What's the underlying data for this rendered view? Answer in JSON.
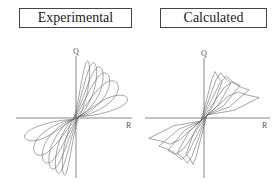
{
  "chart_data": [
    {
      "type": "line",
      "title": "Experimental",
      "xlabel": "R",
      "ylabel": "Q",
      "description": "Hysteresis loops (cyclic load-displacement), pinched near origin, increasing amplitude loops",
      "grid": false,
      "legend": null,
      "series": [
        {
          "name": "loop-1",
          "amplitude_x": 0.25,
          "amplitude_y": 0.95
        },
        {
          "name": "loop-2",
          "amplitude_x": 0.38,
          "amplitude_y": 0.92
        },
        {
          "name": "loop-3",
          "amplitude_x": 0.5,
          "amplitude_y": 0.85
        },
        {
          "name": "loop-4",
          "amplitude_x": 0.62,
          "amplitude_y": 0.75
        },
        {
          "name": "loop-5",
          "amplitude_x": 0.78,
          "amplitude_y": 0.62
        },
        {
          "name": "loop-6",
          "amplitude_x": 0.95,
          "amplitude_y": 0.38
        }
      ]
    },
    {
      "type": "line",
      "title": "Calculated",
      "xlabel": "R",
      "ylabel": "Q",
      "description": "Calculated hysteresis loops with piecewise-linear envelopes, pinched near origin",
      "grid": false,
      "legend": null,
      "series": [
        {
          "name": "loop-1",
          "amplitude_x": 0.3,
          "amplitude_y": 0.8
        },
        {
          "name": "loop-2",
          "amplitude_x": 0.45,
          "amplitude_y": 0.78
        },
        {
          "name": "loop-3",
          "amplitude_x": 0.6,
          "amplitude_y": 0.72
        },
        {
          "name": "loop-4",
          "amplitude_x": 0.75,
          "amplitude_y": 0.62
        },
        {
          "name": "loop-5",
          "amplitude_x": 0.92,
          "amplitude_y": 0.45
        }
      ]
    }
  ],
  "panels": {
    "left": {
      "title": "Experimental",
      "x_axis_label": "R",
      "y_axis_label": "Q"
    },
    "right": {
      "title": "Calculated",
      "x_axis_label": "R",
      "y_axis_label": "Q"
    }
  },
  "colors": {
    "curve": "#6a6a6a",
    "axis": "#555555",
    "box_border": "#444444"
  }
}
